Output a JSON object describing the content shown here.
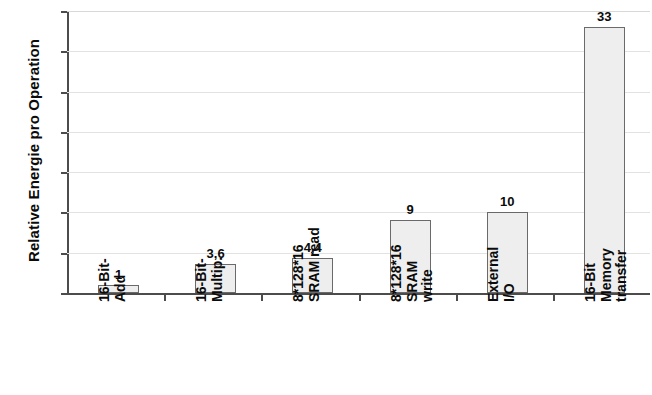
{
  "chart_data": {
    "type": "bar",
    "title": "",
    "xlabel": "",
    "ylabel": "Relative Energie pro Operation",
    "categories": [
      "16-Bit-Add",
      "16-Bit-Multip.",
      "8*128*16 SRAM read",
      "8*128*16 SRAM write",
      "External I/O",
      "16-Bit Memory transfer"
    ],
    "category_label_lines": [
      [
        "16-Bit-",
        "Add"
      ],
      [
        "16-Bit-",
        "Multip."
      ],
      [
        "8*128*16",
        "SRAM read"
      ],
      [
        "8*128*16",
        "SRAM",
        "write"
      ],
      [
        "External",
        "I/O"
      ],
      [
        "16-Bit",
        "Memory",
        "transfer"
      ]
    ],
    "values": [
      1,
      3.6,
      4.4,
      9,
      10,
      33
    ],
    "value_labels": [
      "1",
      "3,6",
      "4,4",
      "9",
      "10",
      "33"
    ],
    "ylim": [
      0,
      35
    ],
    "yticks": [
      0,
      5,
      10,
      15,
      20,
      25,
      30,
      35
    ],
    "ytick_labels": [
      "0",
      "5",
      "10",
      "15",
      "20",
      "25",
      "30",
      "35"
    ],
    "grid": true,
    "grid_axis": "y",
    "legend": "none",
    "bar_fill_color": "#eeeeee",
    "bar_border_color": "#6a6a6a",
    "axis_color": "#4c4c4c",
    "gridline_color": "#e2e2e2",
    "text_color": "#0b0b0b",
    "background_color": "#ffffff"
  }
}
